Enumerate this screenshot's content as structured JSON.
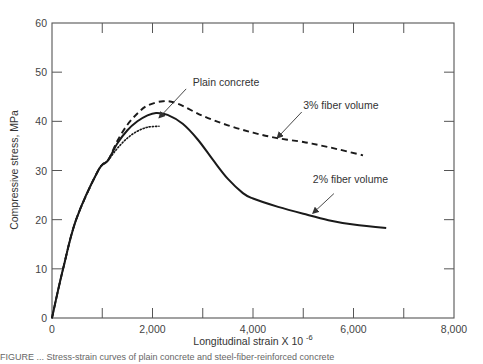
{
  "chart_data": {
    "type": "line",
    "title": "",
    "xlabel": "Longitudinal strain X 10",
    "xlabel_superscript": "-6",
    "ylabel": "Compressive stress, MPa",
    "xlim": [
      0,
      8000
    ],
    "ylim": [
      0,
      60
    ],
    "x_ticks": [
      0,
      2000,
      4000,
      6000,
      8000
    ],
    "x_tick_labels": [
      "0",
      "2,000",
      "4,000",
      "6,000",
      "8,000"
    ],
    "x_minor_ticks": [
      1000,
      3000,
      5000,
      7000
    ],
    "y_ticks": [
      0,
      10,
      20,
      30,
      40,
      50,
      60
    ],
    "y_tick_labels": [
      "0",
      "10",
      "20",
      "30",
      "40",
      "50",
      "60"
    ],
    "grid": false,
    "legend": "none (inline annotations)",
    "series": [
      {
        "name": "Plain concrete",
        "style": "dotted",
        "x": [
          0,
          220,
          480,
          920,
          1110,
          1300,
          1500,
          1700,
          1900,
          2130
        ],
        "y": [
          0,
          10,
          20,
          30,
          32,
          34.5,
          36.6,
          38.0,
          38.8,
          39.0
        ]
      },
      {
        "name": "2% fiber volume",
        "style": "solid",
        "x": [
          0,
          220,
          480,
          920,
          1110,
          1300,
          1500,
          1700,
          1900,
          2070,
          2300,
          2600,
          2900,
          3200,
          3500,
          3800,
          4000,
          4500,
          5000,
          5500,
          6000,
          6650
        ],
        "y": [
          0,
          10,
          20,
          30,
          32,
          35.5,
          38.2,
          40.0,
          41.2,
          41.7,
          41.3,
          39.5,
          36.3,
          32.2,
          28.3,
          25.4,
          24.3,
          22.6,
          21.2,
          19.9,
          19.0,
          18.3
        ]
      },
      {
        "name": "3% fiber volume",
        "style": "dashed",
        "x": [
          0,
          220,
          480,
          920,
          1110,
          1300,
          1500,
          1700,
          1900,
          2210,
          2500,
          3000,
          3500,
          4000,
          4480,
          5000,
          5300,
          5700,
          6190
        ],
        "y": [
          0,
          10,
          20,
          30,
          32,
          36.0,
          39.3,
          41.6,
          43.2,
          44.1,
          43.6,
          41.1,
          39.2,
          37.7,
          36.6,
          35.8,
          35.2,
          34.3,
          33.1
        ]
      }
    ],
    "annotations": [
      {
        "text": "Plain concrete",
        "text_at": [
          2800,
          47.1
        ],
        "arrow_from": [
          2670,
          46.6
        ],
        "arrow_to": [
          2130,
          40.7
        ]
      },
      {
        "text": "3% fiber volume",
        "text_at": [
          5000,
          42.5
        ],
        "arrow_from": [
          4970,
          41.9
        ],
        "arrow_to": [
          4480,
          36.6
        ]
      },
      {
        "text": "2% fiber volume",
        "text_at": [
          5190,
          27.4
        ],
        "arrow_from": [
          5610,
          25.3
        ],
        "arrow_to": [
          5190,
          21.3
        ]
      }
    ]
  },
  "caption": "FIGURE ... Stress-strain curves of plain concrete and steel-fiber-reinforced concrete"
}
